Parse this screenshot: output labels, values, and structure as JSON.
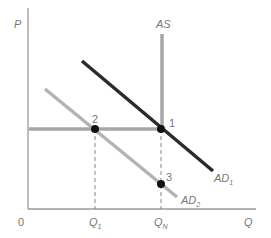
{
  "diagram": {
    "type": "AS-AD diagram",
    "axes": {
      "y_label": "P",
      "x_label": "Q",
      "origin_label": "0",
      "x_ticks": [
        {
          "main": "Q",
          "sub": "1"
        },
        {
          "main": "Q",
          "sub": "N"
        }
      ]
    },
    "curves": {
      "as": {
        "label": "AS",
        "color": "#a6a6a6"
      },
      "ad1": {
        "main": "AD",
        "sub": "1",
        "color": "#2b2b2b"
      },
      "ad2": {
        "main": "AD",
        "sub": "2",
        "color": "#b3b3b3"
      },
      "price_level_line": {
        "color": "#a6a6a6"
      }
    },
    "points": [
      {
        "label": "1"
      },
      {
        "label": "2"
      },
      {
        "label": "3"
      }
    ],
    "colors": {
      "axis": "#9a9a9a",
      "text": "#777777",
      "point": "#111111",
      "dashed": "#888888"
    }
  }
}
